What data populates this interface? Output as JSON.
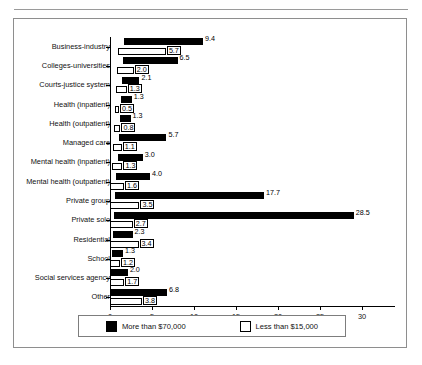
{
  "figure": {
    "xaxis_title": "Percentage"
  },
  "legend": {
    "items": [
      {
        "label": "More than $70,000",
        "swatch": "dark",
        "color": "#000000"
      },
      {
        "label": "Less than $15,000",
        "swatch": "light",
        "color": "#ffffff"
      }
    ]
  },
  "chart_data": {
    "type": "bar",
    "orientation": "horizontal",
    "title": "",
    "xlabel": "Percentage",
    "ylabel": "",
    "xlim": [
      0,
      30
    ],
    "xticks": [
      0,
      5,
      10,
      15,
      20,
      25,
      30
    ],
    "xtick_labels": [
      "0",
      "5",
      "10",
      "15",
      "20",
      "25",
      "30"
    ],
    "grid": false,
    "legend_position": "bottom",
    "categories": [
      "Business-industry",
      "Colleges-universities",
      "Courts-justice system",
      "Health (inpatient)",
      "Health (outpatient)",
      "Managed care",
      "Mental health (inpatient)",
      "Mental health (outpatient)",
      "Private group",
      "Private solo",
      "Residential",
      "School",
      "Social services agency",
      "Other"
    ],
    "series": [
      {
        "name": "More than $70,000",
        "color": "#000000",
        "values": [
          9.4,
          6.5,
          2.1,
          1.3,
          1.3,
          5.7,
          3.0,
          4.0,
          17.7,
          28.5,
          2.3,
          1.3,
          2.0,
          6.8
        ]
      },
      {
        "name": "Less than $15,000",
        "color": "#ffffff",
        "values": [
          5.7,
          2.0,
          1.3,
          0.5,
          0.8,
          1.1,
          1.3,
          1.6,
          3.5,
          2.7,
          3.4,
          1.2,
          1.7,
          3.8
        ]
      }
    ]
  }
}
